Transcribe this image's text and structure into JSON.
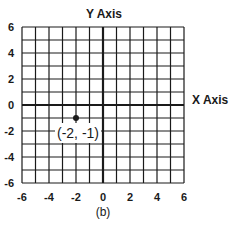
{
  "chart_data": {
    "type": "scatter",
    "title": "",
    "xlabel": "X Axis",
    "ylabel": "Y Axis",
    "xlim": [
      -6,
      6
    ],
    "ylim": [
      -6,
      6
    ],
    "grid": true,
    "grid_step": 1,
    "x_ticks": [
      -6,
      -4,
      -2,
      0,
      2,
      4,
      6
    ],
    "y_ticks": [
      6,
      4,
      2,
      0,
      -2,
      -4,
      -6
    ],
    "points": [
      {
        "x": -2,
        "y": -1,
        "label": "(-2, -1)"
      }
    ],
    "caption": "(b)"
  },
  "figure": {
    "y_axis_title": "Y Axis",
    "x_axis_title": "X Axis",
    "caption": "(b)",
    "point_label": "(-2, -1)",
    "x_tick_labels": [
      "-6",
      "-4",
      "-2",
      "0",
      "2",
      "4",
      "6"
    ],
    "y_tick_labels": [
      "6",
      "4",
      "2",
      "0",
      "-2",
      "-4",
      "-6"
    ],
    "line_color": "#1a1a1a",
    "background": "#ffffff"
  }
}
